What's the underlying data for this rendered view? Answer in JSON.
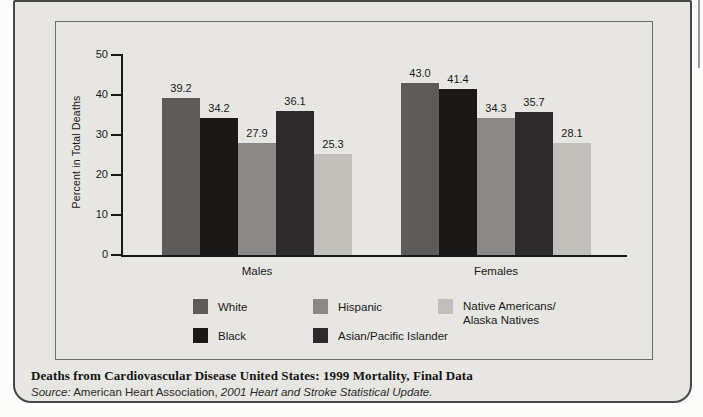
{
  "chart_data": {
    "type": "bar",
    "categories": [
      "Males",
      "Females"
    ],
    "series": [
      {
        "name": "White",
        "values": [
          39.2,
          43.0
        ],
        "color": "#5e5b5b"
      },
      {
        "name": "Black",
        "values": [
          34.2,
          41.4
        ],
        "color": "#1b1818"
      },
      {
        "name": "Hispanic",
        "values": [
          27.9,
          34.3
        ],
        "color": "#8b8888"
      },
      {
        "name": "Asian/Pacific Islander",
        "values": [
          36.1,
          35.7
        ],
        "color": "#2d2a2b"
      },
      {
        "name": "Native Americans/Alaska Natives",
        "values": [
          25.3,
          28.1
        ],
        "color": "#c1bfb9"
      }
    ],
    "title": "",
    "xlabel": "",
    "ylabel": "Percent in Total Deaths",
    "ylim": [
      0,
      50
    ],
    "yticks": [
      0,
      10,
      20,
      30,
      40,
      50
    ],
    "grid": false,
    "value_labels_shown": true,
    "legend_position": "bottom"
  },
  "legend": {
    "items": [
      {
        "lines": [
          "White"
        ],
        "color": "#5e5b5b"
      },
      {
        "lines": [
          "Black"
        ],
        "color": "#1b1818"
      },
      {
        "lines": [
          "Hispanic"
        ],
        "color": "#8b8888"
      },
      {
        "lines": [
          "Asian/Pacific Islander"
        ],
        "color": "#2d2a2b"
      },
      {
        "lines": [
          "Native Americans/",
          "Alaska Natives"
        ],
        "color": "#c1bfb9"
      }
    ]
  },
  "caption": {
    "title": "Deaths from Cardiovascular Disease United States: 1999 Mortality, Final Data",
    "source": {
      "prefix": "Source:",
      "organization": "American Heart Association,",
      "publication": "2001 Heart and Stroke Statistical Update."
    }
  },
  "colors": {
    "card_background": "#e8e6e2",
    "card_border": "#474747",
    "frame_border": "#6d6d6d",
    "axis": "#1a1a1a",
    "text": "#1a1a1a"
  }
}
